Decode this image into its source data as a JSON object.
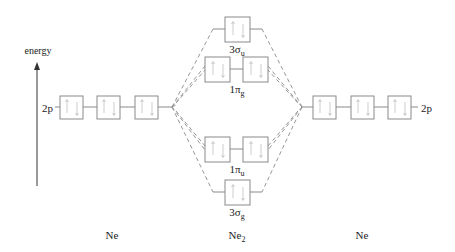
{
  "diagram": {
    "type": "molecular-orbital-diagram",
    "axis": {
      "label": "energy"
    },
    "left_atom": {
      "name": "Ne",
      "orbital_label": "2p",
      "orbital_count": 3,
      "electrons": 6
    },
    "right_atom": {
      "name": "Ne",
      "orbital_label": "2p",
      "orbital_count": 3,
      "electrons": 6
    },
    "molecule": {
      "name_base": "Ne",
      "name_sub": "2",
      "orbitals": [
        {
          "id": "3su",
          "label_base": "3σ",
          "label_sub": "u",
          "degeneracy": 1,
          "electrons": 2,
          "type": "antibonding"
        },
        {
          "id": "1pg",
          "label_base": "1π",
          "label_sub": "g",
          "degeneracy": 2,
          "electrons": 4,
          "type": "antibonding"
        },
        {
          "id": "1pu",
          "label_base": "1π",
          "label_sub": "u",
          "degeneracy": 2,
          "electrons": 4,
          "type": "bonding"
        },
        {
          "id": "3sg",
          "label_base": "3σ",
          "label_sub": "g",
          "degeneracy": 1,
          "electrons": 2,
          "type": "bonding"
        }
      ]
    },
    "colors": {
      "box_stroke": "#8a8a8a",
      "text": "#222222",
      "spin_arrows": "#b8b8b8"
    }
  }
}
